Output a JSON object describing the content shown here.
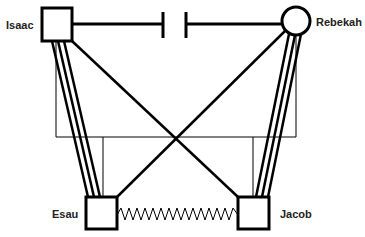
{
  "diagram": {
    "type": "genogram",
    "colors": {
      "line": "#000000",
      "background": "#ffffff",
      "text": "#222222"
    },
    "people": [
      {
        "id": "isaac",
        "name": "Isaac",
        "sex": "male",
        "shape": "square"
      },
      {
        "id": "rebekah",
        "name": "Rebekah",
        "sex": "female",
        "shape": "circle"
      },
      {
        "id": "esau",
        "name": "Esau",
        "sex": "male",
        "shape": "square"
      },
      {
        "id": "jacob",
        "name": "Jacob",
        "sex": "male",
        "shape": "square"
      }
    ],
    "relationships": [
      {
        "from": "isaac",
        "to": "rebekah",
        "type": "marriage-cutoff",
        "style": "thick line with separation gap"
      },
      {
        "from": "isaac",
        "to": "esau",
        "type": "very-close / fused",
        "style": "triple line"
      },
      {
        "from": "rebekah",
        "to": "jacob",
        "type": "very-close / fused",
        "style": "triple line"
      },
      {
        "from": "isaac",
        "to": "jacob",
        "type": "distant / connection",
        "style": "single thick line"
      },
      {
        "from": "rebekah",
        "to": "esau",
        "type": "distant / connection",
        "style": "single thick line"
      },
      {
        "from": "esau",
        "to": "jacob",
        "type": "conflict",
        "style": "zigzag"
      }
    ],
    "family_lines": {
      "style": "thin",
      "description": "thin genogram descent lines connecting parents to children"
    }
  }
}
